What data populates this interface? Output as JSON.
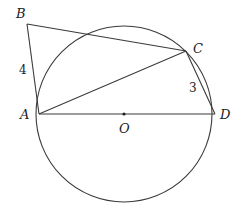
{
  "diagram": {
    "type": "geometry",
    "circle": {
      "center_label": "O",
      "cx": 124,
      "cy": 114,
      "r": 88
    },
    "points": {
      "A": {
        "label": "A",
        "x": 39,
        "y": 114,
        "lx": 20,
        "ly": 119
      },
      "B": {
        "label": "B",
        "x": 27,
        "y": 24,
        "lx": 16,
        "ly": 18
      },
      "C": {
        "label": "C",
        "x": 186,
        "y": 51,
        "lx": 193,
        "ly": 53
      },
      "D": {
        "label": "D",
        "x": 215,
        "y": 114,
        "lx": 220,
        "ly": 119
      },
      "O": {
        "label": "O",
        "x": 124,
        "y": 114,
        "lx": 119,
        "ly": 133
      }
    },
    "segments": [
      "AB",
      "BC",
      "AC",
      "CD",
      "AD"
    ],
    "lengths": {
      "AB": {
        "value": "4",
        "x": 19,
        "y": 74
      },
      "CD": {
        "value": "3",
        "x": 189,
        "y": 92
      }
    }
  }
}
